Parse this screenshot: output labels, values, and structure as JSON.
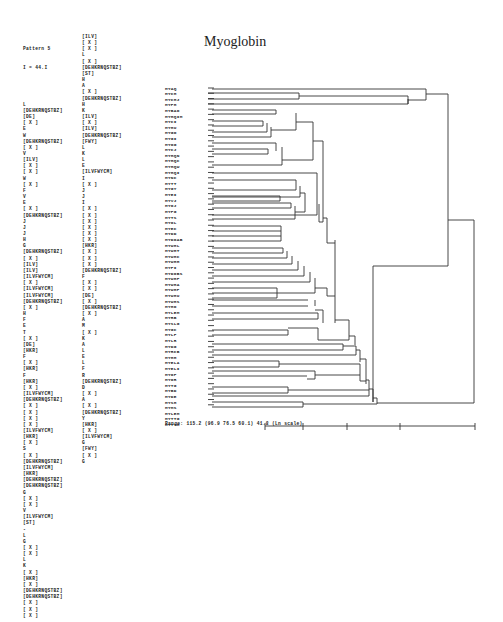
{
  "figure": {
    "title": "Myoglobin",
    "pattern_header": [
      "Pattern 5",
      "I = 44.I"
    ],
    "pattern_column_1": [
      "L",
      "[DEHKRNQSTBZ]",
      "[DE]",
      "[ X ]",
      "E",
      "W",
      "[DEHKRNQSTBZ]",
      "[ X ]",
      "V",
      "[ILV]",
      "[ X ]",
      "[ X ]",
      "W",
      "[ X ]",
      "F",
      "V",
      "E",
      "[ X ]",
      "[DEHKRNQSTBZ]",
      "J",
      "J",
      "J",
      "H",
      "G",
      "[DEHKRNQSTBZ]",
      "[ X ]",
      "[ILV]",
      "[ILV]",
      "[ILVFWYCM]",
      "[ X ]",
      "[ILVFWYCM]",
      "[ILVFWYCM]",
      "[DEHKRNQSTBZ]",
      "[ X ]",
      "H",
      "F",
      "E",
      "T",
      "[ X ]",
      "[DE]",
      "[HKR]",
      "F",
      "[ X ]",
      "[HKR]",
      "F",
      "[HKR]",
      "[ X ]",
      "[ILVFWYCM]",
      "[DEHKRNQSTBZ]",
      "[ X ]",
      "[ X ]",
      "[ X ]",
      "[ X ]",
      "[ILVFWYCM]",
      "[HKR]",
      "[ X ]",
      "S",
      "[ X ]",
      "[DEHKRNQSTBZ]",
      "[ILVFWYCM]",
      "[HKR]",
      "[DEHKRNQSTBZ]",
      "[DEHKRNQSTBZ]",
      "G",
      "[ X ]",
      "[ X ]",
      "V",
      "[ILVFWYCM]",
      "[ST]",
      "-",
      "L",
      "G",
      "[ X ]",
      "[ X ]",
      "L",
      "K",
      "[ X ]",
      "[HKR]",
      "[ X ]",
      "[DEHKRNQSTBZ]",
      "[DEHKRNQSTBZ]",
      "[ X ]",
      "[ X ]",
      "[ X ]"
    ],
    "pattern_column_2": [
      "[ILV]",
      "[ X ]",
      "[ X ]",
      "L",
      "[ X ]",
      "[DEHKRNQSTBZ]",
      "[ST]",
      "H",
      "A",
      "[ X ]",
      "[DEHKRNQSTBZ]",
      "H",
      "K",
      "[ILV]",
      "[ X ]",
      "[ILV]",
      "[DEHKRNQSTBZ]",
      "[FWY]",
      "L",
      "K",
      "L",
      "E",
      "[ILVFWYCM]",
      "I",
      "[ X ]",
      "J",
      "J",
      "I",
      "[ X ]",
      "[ X ]",
      "[ X ]",
      "[ X ]",
      "[ X ]",
      "[ X ]",
      "[HKR]",
      "[ X ]",
      "[ X ]",
      "[ X ]",
      "[DEHKRNQSTBZ]",
      "F",
      "[ X ]",
      "[ X ]",
      "[DE]",
      "[ X ]",
      "[DEHKRNQSTBZ]",
      "[ X ]",
      "A",
      "M",
      "[ X ]",
      "K",
      "A",
      "L",
      "E",
      "L",
      "F",
      "R",
      "[DEHKRNQSTBZ]",
      "D",
      "[ X ]",
      "A",
      "[ X ]",
      "[DEHKRNQSTBZ]",
      "Y",
      "[HKR]",
      "[ X ]",
      "[ILVFWYCM]",
      "G",
      "[FWY]",
      "[ X ]",
      "G"
    ],
    "leaf_labels": [
      "MYAQ",
      "MYCH",
      "MYCHJ",
      "MYPH",
      "MYBAO",
      "MYHQIM",
      "MYCI",
      "MYHU",
      "MYGO",
      "MYGI",
      "MYOG",
      "MYCJ",
      "MYHQN",
      "MYHQC",
      "MYHQW",
      "MYHQI",
      "MYNC",
      "MYTT",
      "MYGY",
      "MYEI",
      "MYVJ",
      "MYOJ",
      "MYPG",
      "MYTS",
      "MYOL",
      "MYEC",
      "MYDD",
      "MYDOAB",
      "MYWHL",
      "MYWHT",
      "MYWHC",
      "MYWHH",
      "MYPI",
      "MYDOBS",
      "MYWHF",
      "MYWHA",
      "MYWHP",
      "MYWHU",
      "MYWHS",
      "MYHO",
      "MYLEM",
      "MYRB",
      "MYSLG",
      "MYGC",
      "MYLF",
      "MYLR",
      "MYDG",
      "MYRCB",
      "MYHH",
      "MYELA",
      "MYELI",
      "MYOF",
      "MYOR",
      "MYTG",
      "MYBD",
      "MYDE",
      "MYSH",
      "MYMS",
      "MYLEM",
      "MYTTG",
      "MYTTH"
    ],
    "range_label": "Range: 115.2 (96.9 76.5 60.1) 41.8 (Ln scale)",
    "scale_ticks_x": [
      265,
      303,
      347,
      400,
      475
    ]
  }
}
